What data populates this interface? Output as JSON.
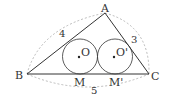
{
  "diagram": {
    "type": "geometry",
    "points": {
      "A": {
        "label": "A",
        "x": 105,
        "y": 13
      },
      "B": {
        "label": "B",
        "x": 27,
        "y": 74
      },
      "C": {
        "label": "C",
        "x": 149,
        "y": 74
      },
      "M": {
        "label": "M",
        "x": 80,
        "y": 74
      },
      "M2": {
        "label": "M'",
        "x": 115,
        "y": 74
      }
    },
    "circles": [
      {
        "label": "O",
        "cx": 80,
        "cy": 56.5,
        "r": 17.5
      },
      {
        "label": "O'",
        "cx": 115,
        "cy": 56.5,
        "r": 17.5
      }
    ],
    "side_lengths": {
      "AB": "4",
      "AC": "3",
      "BC": "5"
    },
    "colors": {
      "line": "#333333",
      "dashed": "#aaaaaa"
    }
  }
}
